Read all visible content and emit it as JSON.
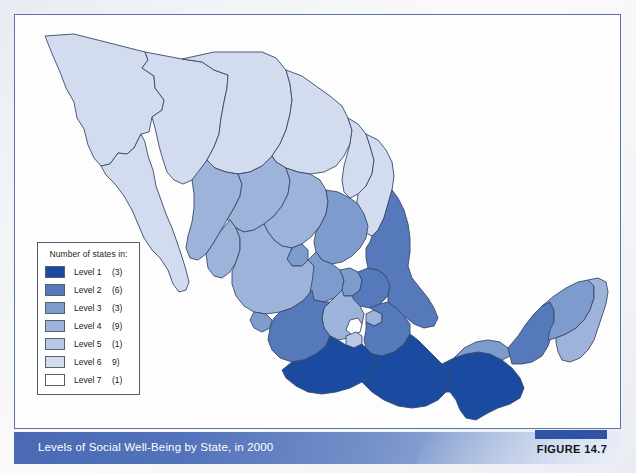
{
  "figure": {
    "caption": "Levels of Social Well-Being by State, in 2000",
    "number_label": "FIGURE 14.7"
  },
  "legend": {
    "title": "Number of states in:",
    "rows": [
      {
        "label": "Level 1",
        "count": "(3)",
        "color": "#1b4ba0"
      },
      {
        "label": "Level 2",
        "count": "(6)",
        "color": "#5579ba"
      },
      {
        "label": "Level 3",
        "count": "(3)",
        "color": "#7e9bcd"
      },
      {
        "label": "Level 4",
        "count": "(9)",
        "color": "#9db3d9"
      },
      {
        "label": "Level 5",
        "count": "(1)",
        "color": "#b9c9e5"
      },
      {
        "label": "Level 6",
        "count": "9)",
        "color": "#d3dcee"
      },
      {
        "label": "Level 7",
        "count": "(1)",
        "color": "#ffffff"
      }
    ]
  },
  "chart_data": {
    "type": "map",
    "title": "Levels of Social Well-Being by State, in 2000",
    "region": "Mexico",
    "categories": [
      "Level 1",
      "Level 2",
      "Level 3",
      "Level 4",
      "Level 5",
      "Level 6",
      "Level 7"
    ],
    "values": [
      3,
      6,
      3,
      9,
      1,
      9,
      1
    ],
    "colors": [
      "#1b4ba0",
      "#5579ba",
      "#7e9bcd",
      "#9db3d9",
      "#b9c9e5",
      "#d3dcee",
      "#ffffff"
    ],
    "legend_position": "lower-left",
    "grid": false
  },
  "colors": {
    "level1": "#1b4ba0",
    "level2": "#5579ba",
    "level3": "#7e9bcd",
    "level4": "#9db3d9",
    "level5": "#b9c9e5",
    "level6": "#d3dcee",
    "level7": "#ffffff",
    "frame_border": "#5b72ae",
    "caption_bar_left": "#4a69b4",
    "caption_bar_right": "#b9c7e6",
    "figure_tab": "#2f54a3",
    "state_outline": "#3a4a6b"
  }
}
